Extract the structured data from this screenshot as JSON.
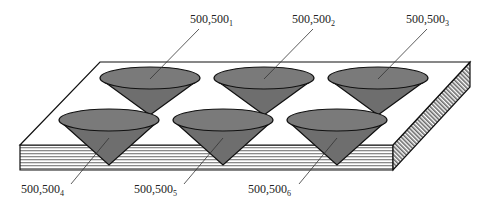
{
  "diagram": {
    "colors": {
      "cone_fill": "#6e6e6e",
      "plate_top": "#ffffff",
      "stroke": "#111111",
      "stripe": "#999999"
    },
    "labels": [
      {
        "id": "cone-1",
        "base": "500,500",
        "sub": "1"
      },
      {
        "id": "cone-2",
        "base": "500,500",
        "sub": "2"
      },
      {
        "id": "cone-3",
        "base": "500,500",
        "sub": "3"
      },
      {
        "id": "cone-4",
        "base": "500,500",
        "sub": "4"
      },
      {
        "id": "cone-5",
        "base": "500,500",
        "sub": "5"
      },
      {
        "id": "cone-6",
        "base": "500,500",
        "sub": "6"
      }
    ]
  }
}
